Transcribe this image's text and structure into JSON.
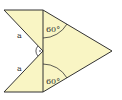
{
  "diagram": {
    "type": "geometry-figure",
    "fill_color": "#f9f5c4",
    "stroke_color": "#333333",
    "side_labels": [
      {
        "id": "upper-side",
        "text": "a"
      },
      {
        "id": "lower-side",
        "text": "a"
      }
    ],
    "angle_labels": [
      {
        "id": "upper-angle",
        "text": "60°"
      },
      {
        "id": "lower-angle",
        "text": "60°"
      }
    ],
    "right_angle_marker": {
      "symbol": "·"
    }
  }
}
